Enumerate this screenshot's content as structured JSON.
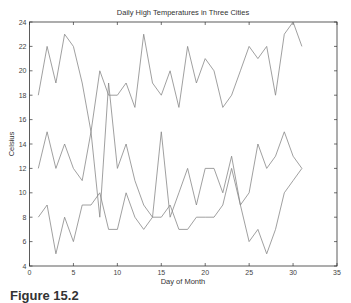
{
  "caption": "Figure 15.2",
  "chart_data": {
    "type": "line",
    "title": "Daily High Temperatures in Three Cities",
    "xlabel": "Day of Month",
    "ylabel": "Celsius",
    "xlim": [
      0,
      35
    ],
    "ylim": [
      4,
      24
    ],
    "xticks": [
      0,
      5,
      10,
      15,
      20,
      25,
      30,
      35
    ],
    "yticks": [
      4,
      6,
      8,
      10,
      12,
      14,
      16,
      18,
      20,
      22,
      24
    ],
    "grid": false,
    "legend": null,
    "line_color": "#888888",
    "x": [
      1,
      2,
      3,
      4,
      5,
      6,
      7,
      8,
      9,
      10,
      11,
      12,
      13,
      14,
      15,
      16,
      17,
      18,
      19,
      20,
      21,
      22,
      23,
      24,
      25,
      26,
      27,
      28,
      29,
      30,
      31
    ],
    "series": [
      {
        "name": "City 1",
        "values": [
          18,
          22,
          19,
          23,
          22,
          19,
          15,
          20,
          18,
          18,
          19,
          17,
          23,
          19,
          18,
          20,
          17,
          22,
          19,
          21,
          20,
          17,
          18,
          20,
          22,
          21,
          22,
          18,
          23,
          24,
          22
        ]
      },
      {
        "name": "City 2",
        "values": [
          12,
          15,
          12,
          14,
          12,
          11,
          15,
          8,
          19,
          12,
          14,
          11,
          9,
          8,
          8,
          9,
          7,
          7,
          8,
          8,
          8,
          9,
          12,
          9,
          6,
          7,
          5,
          7,
          10,
          11,
          12
        ]
      },
      {
        "name": "City 3",
        "values": [
          8,
          9,
          5,
          8,
          6,
          9,
          9,
          10,
          7,
          7,
          10,
          8,
          7,
          8,
          15,
          8,
          10,
          12,
          9,
          12,
          12,
          10,
          13,
          9,
          10,
          14,
          12,
          13,
          15,
          13,
          12
        ]
      }
    ]
  }
}
